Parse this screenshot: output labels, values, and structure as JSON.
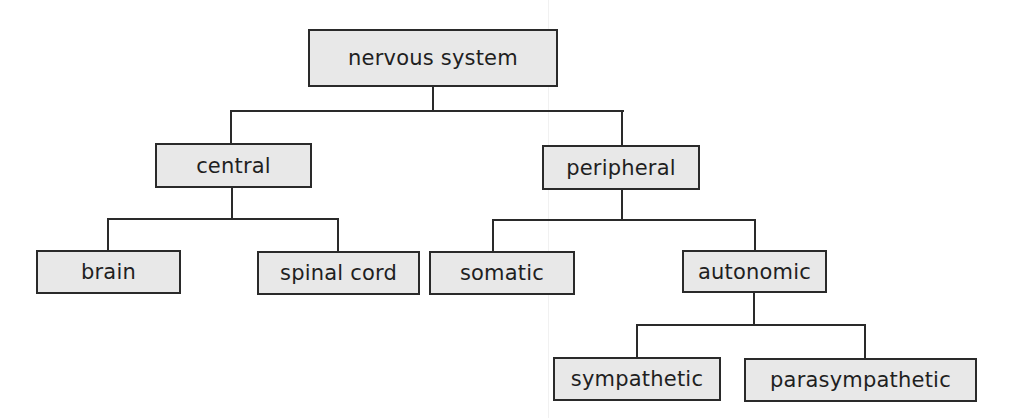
{
  "diagram": {
    "type": "hierarchy",
    "title": "nervous system",
    "colors": {
      "box_fill": "#e8e8e8",
      "line": "#2a2a2a",
      "text": "#1f1f1f",
      "background": "#ffffff"
    },
    "nodes": {
      "root": "nervous system",
      "central": "central",
      "peripheral": "peripheral",
      "brain": "brain",
      "spinal_cord": "spinal cord",
      "somatic": "somatic",
      "autonomic": "autonomic",
      "sympathetic": "sympathetic",
      "parasympathetic": "parasympathetic"
    },
    "edges": [
      [
        "nervous system",
        "central"
      ],
      [
        "nervous system",
        "peripheral"
      ],
      [
        "central",
        "brain"
      ],
      [
        "central",
        "spinal cord"
      ],
      [
        "peripheral",
        "somatic"
      ],
      [
        "peripheral",
        "autonomic"
      ],
      [
        "autonomic",
        "sympathetic"
      ],
      [
        "autonomic",
        "parasympathetic"
      ]
    ]
  }
}
